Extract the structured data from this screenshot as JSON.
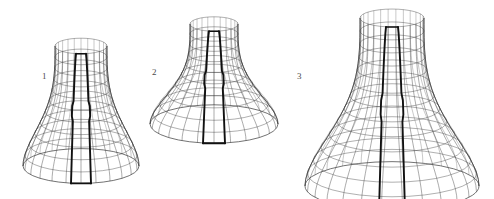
{
  "figure": {
    "background_color": "#ffffff",
    "mesh_color": "#3a3a3a",
    "seam_color": "#111111",
    "label_color": "#4a4a4a",
    "width": 494,
    "height": 199,
    "items": [
      {
        "label": "1",
        "name": "wireframe-surface-1",
        "description": "narrow tall bell-shaped wireframe mesh surface of revolution with dark vertical seam strip",
        "label_x": 42,
        "label_y": 72,
        "bounds": {
          "x": 22,
          "y": 42,
          "width": 118,
          "height": 126
        },
        "geometry": {
          "cx": 81,
          "top_y": 46,
          "bottom_y": 166,
          "top_radius_x": 26,
          "bottom_radius_x": 58,
          "ellipse_ratio": 0.3,
          "waist_factor": 0.4,
          "meridians": 24,
          "parallels": 11,
          "seam_half_width_top": 5,
          "seam_half_width_bottom": 10
        }
      },
      {
        "label": "2",
        "name": "wireframe-surface-2",
        "description": "short wide bell-shaped wireframe mesh surface of revolution with dark vertical seam strip",
        "label_x": 152,
        "label_y": 68,
        "bounds": {
          "x": 150,
          "y": 20,
          "width": 130,
          "height": 108
        },
        "geometry": {
          "cx": 214,
          "top_y": 24,
          "bottom_y": 124,
          "top_radius_x": 24,
          "bottom_radius_x": 64,
          "ellipse_ratio": 0.3,
          "waist_factor": 0.46,
          "meridians": 24,
          "parallels": 10,
          "seam_half_width_top": 5,
          "seam_half_width_bottom": 11
        }
      },
      {
        "label": "3",
        "name": "wireframe-surface-3",
        "description": "large tall bell-shaped wireframe mesh surface of revolution with dark vertical seam strip",
        "label_x": 297,
        "label_y": 72,
        "bounds": {
          "x": 305,
          "y": 14,
          "width": 175,
          "height": 176
        },
        "geometry": {
          "cx": 392,
          "top_y": 18,
          "bottom_y": 186,
          "top_radius_x": 32,
          "bottom_radius_x": 87,
          "ellipse_ratio": 0.28,
          "waist_factor": 0.42,
          "meridians": 26,
          "parallels": 13,
          "seam_half_width_top": 6,
          "seam_half_width_bottom": 13
        }
      }
    ]
  }
}
